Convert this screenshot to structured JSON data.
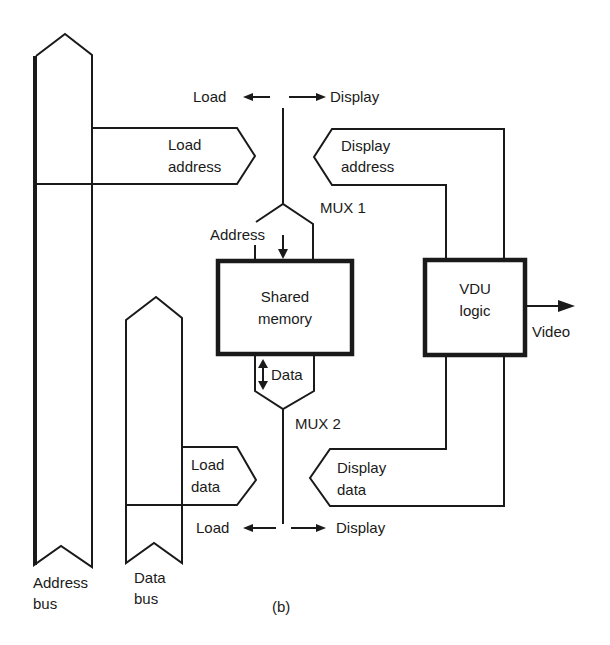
{
  "figure": {
    "caption": "(b)",
    "colors": {
      "stroke": "#1a1a1a",
      "background": "#ffffff"
    }
  },
  "buses": {
    "address_bus": {
      "line1": "Address",
      "line2": "bus"
    },
    "data_bus": {
      "line1": "Data",
      "line2": "bus"
    }
  },
  "signals": {
    "load_address": {
      "line1": "Load",
      "line2": "address"
    },
    "display_address": {
      "line1": "Display",
      "line2": "address"
    },
    "load_data": {
      "line1": "Load",
      "line2": "data"
    },
    "display_data": {
      "line1": "Display",
      "line2": "data"
    }
  },
  "mux1": {
    "label": "MUX 1",
    "select_left": "Load",
    "select_right": "Display",
    "output_label": "Address"
  },
  "mux2": {
    "label": "MUX 2",
    "select_left": "Load",
    "select_right": "Display",
    "output_label": "Data"
  },
  "blocks": {
    "shared_memory": {
      "line1": "Shared",
      "line2": "memory"
    },
    "vdu_logic": {
      "line1": "VDU",
      "line2": "logic"
    }
  },
  "outputs": {
    "video": "Video"
  }
}
